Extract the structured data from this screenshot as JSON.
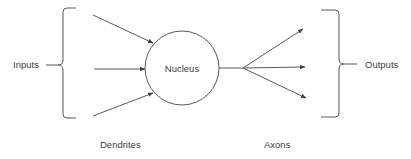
{
  "diagram": {
    "labels": {
      "inputs": "Inputs",
      "nucleus": "Nucleus",
      "outputs": "Outputs",
      "dendrites": "Dendrites",
      "axons": "Axons"
    },
    "colors": {
      "stroke": "#595959",
      "text": "#404040",
      "background": "#ffffff"
    },
    "nodes": [
      {
        "id": "nucleus",
        "shape": "circle",
        "label": "Nucleus"
      }
    ],
    "edges": [
      {
        "from": "input-1",
        "to": "nucleus",
        "group": "dendrites"
      },
      {
        "from": "input-2",
        "to": "nucleus",
        "group": "dendrites"
      },
      {
        "from": "input-3",
        "to": "nucleus",
        "group": "dendrites"
      },
      {
        "from": "nucleus",
        "to": "output-1",
        "group": "axons"
      },
      {
        "from": "nucleus",
        "to": "output-2",
        "group": "axons"
      },
      {
        "from": "nucleus",
        "to": "output-3",
        "group": "axons"
      }
    ]
  }
}
